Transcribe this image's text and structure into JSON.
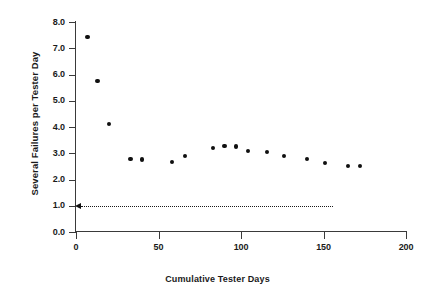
{
  "chart_data": {
    "type": "scatter",
    "title": "",
    "xlabel": "Cumulative Tester Days",
    "ylabel": "Several Failures per Tester Day",
    "xlim": [
      0,
      200
    ],
    "ylim": [
      0.0,
      8.0
    ],
    "grid": false,
    "legend": null,
    "xticks": [
      "0",
      "50",
      "100",
      "150",
      "200"
    ],
    "xtick_values": [
      0,
      50,
      100,
      150,
      200
    ],
    "yticks": [
      "0.0",
      "1.0",
      "2.0",
      "3.0",
      "4.0",
      "5.0",
      "6.0",
      "7.0",
      "8.0"
    ],
    "ytick_values": [
      0.0,
      1.0,
      2.0,
      3.0,
      4.0,
      5.0,
      6.0,
      7.0,
      8.0
    ],
    "marker": "filled-circle",
    "marker_color": "#101010",
    "series": [
      {
        "name": "Failure rate",
        "points": [
          {
            "x": 7,
            "y": 7.43
          },
          {
            "x": 13,
            "y": 5.75
          },
          {
            "x": 20,
            "y": 4.12
          },
          {
            "x": 33,
            "y": 2.78
          },
          {
            "x": 40,
            "y": 2.76
          },
          {
            "x": 58,
            "y": 2.66
          },
          {
            "x": 66,
            "y": 2.88
          },
          {
            "x": 83,
            "y": 3.2
          },
          {
            "x": 90,
            "y": 3.28
          },
          {
            "x": 97,
            "y": 3.26
          },
          {
            "x": 104,
            "y": 3.1
          },
          {
            "x": 116,
            "y": 3.05
          },
          {
            "x": 126,
            "y": 2.9
          },
          {
            "x": 140,
            "y": 2.78
          },
          {
            "x": 151,
            "y": 2.63
          },
          {
            "x": 165,
            "y": 2.52
          },
          {
            "x": 172,
            "y": 2.5
          }
        ]
      }
    ],
    "annotations": [
      {
        "name": "objective-threshold",
        "type": "dotted-line-with-left-arrow",
        "y": 1.0,
        "x_start": 0,
        "x_end": 156,
        "color": "#1a1a1a"
      }
    ]
  }
}
